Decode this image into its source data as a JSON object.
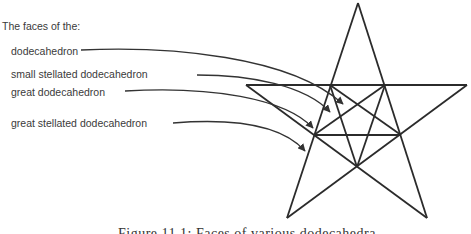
{
  "heading": "The faces of the:",
  "labels": [
    {
      "id": "dodecahedron",
      "text": "dodecahedron"
    },
    {
      "id": "small-stellated-dodecahedron",
      "text": "small stellated dodecahedron"
    },
    {
      "id": "great-dodecahedron",
      "text": "great dodecahedron"
    },
    {
      "id": "great-stellated-dodecahedron",
      "text": "great stellated dodecahedron"
    }
  ],
  "caption": "Figure 11.1: Faces of various dodecahedra",
  "colors": {
    "line": "#2b2b2b",
    "arrow": "#333333",
    "text": "#3a3a3a"
  }
}
